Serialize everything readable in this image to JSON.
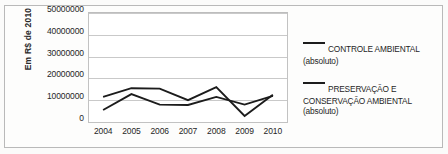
{
  "chart_data": {
    "type": "line",
    "title": "",
    "xlabel": "",
    "ylabel": "Em R$ de 2010",
    "x": [
      "2004",
      "2005",
      "2006",
      "2007",
      "2008",
      "2009",
      "2010"
    ],
    "categories": [
      "2004",
      "2005",
      "2006",
      "2007",
      "2008",
      "2009",
      "2010"
    ],
    "ylim": [
      0,
      50000000
    ],
    "ytick_values": [
      0,
      10000000,
      20000000,
      30000000,
      40000000,
      50000000
    ],
    "ytick_labels": [
      "0",
      "10000000",
      "20000000",
      "30000000",
      "40000000",
      "50000000"
    ],
    "grid": "horizontal",
    "legend_position": "right",
    "series": [
      {
        "name": "CONTROLE AMBIENTAL",
        "qualifier": "(absoluto)",
        "color": "#1c1c1c",
        "values": [
          5500000,
          12800000,
          8000000,
          7800000,
          11500000,
          8000000,
          12000000
        ]
      },
      {
        "name": "PRESERVAÇÃO E CONSERVAÇÃO AMBIENTAL",
        "qualifier": "(absoluto)",
        "color": "#1c1c1c",
        "values": [
          11500000,
          15500000,
          15300000,
          10000000,
          16000000,
          2800000,
          12500000
        ]
      }
    ]
  },
  "legend": {
    "items": [
      {
        "label": "CONTROLE AMBIENTAL",
        "sub": "(absoluto)"
      },
      {
        "label": "PRESERVAÇÃO E",
        "label2": "CONSERVAÇÃO AMBIENTAL",
        "sub": "(absoluto)"
      }
    ]
  }
}
